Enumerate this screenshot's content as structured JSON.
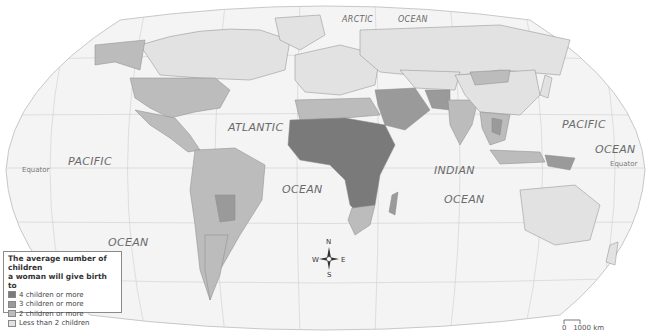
{
  "map": {
    "type": "choropleth world map",
    "projection": "Robinson-like",
    "ocean_labels": [
      {
        "id": "arctic",
        "text": "ARCTIC"
      },
      {
        "id": "arctic-ocean",
        "text": "OCEAN"
      },
      {
        "id": "pacific-west",
        "text": "PACIFIC"
      },
      {
        "id": "atlantic",
        "text": "ATLANTIC"
      },
      {
        "id": "atlantic-ocean",
        "text": "OCEAN"
      },
      {
        "id": "indian",
        "text": "INDIAN"
      },
      {
        "id": "indian-ocean",
        "text": "OCEAN"
      },
      {
        "id": "pacific-east",
        "text": "PACIFIC"
      },
      {
        "id": "pacific-east-ocean",
        "text": "OCEAN"
      },
      {
        "id": "pacific-west-ocean",
        "text": "OCEAN"
      }
    ],
    "equator_labels": {
      "left": "Equator",
      "right": "Equator"
    },
    "colors": {
      "ocean": "#f4f4f4",
      "graticule": "#c8c8c8",
      "border": "#8a8a8a",
      "four_plus": "#7a7a7a",
      "three_plus": "#9a9a9a",
      "two_plus": "#bcbcbc",
      "less_two": "#e2e2e2"
    }
  },
  "legend": {
    "title_line1": "The average number of children",
    "title_line2": "a woman will give birth to",
    "items": [
      {
        "label": "4 children or more",
        "color": "#7a7a7a"
      },
      {
        "label": "3 children or more",
        "color": "#9a9a9a"
      },
      {
        "label": "2 children or more",
        "color": "#bcbcbc"
      },
      {
        "label": "Less than 2 children",
        "color": "#e2e2e2"
      }
    ]
  },
  "compass": {
    "n": "N",
    "s": "S",
    "w": "W",
    "e": "E"
  },
  "scale": {
    "zero": "0",
    "distance": "1000 km"
  }
}
